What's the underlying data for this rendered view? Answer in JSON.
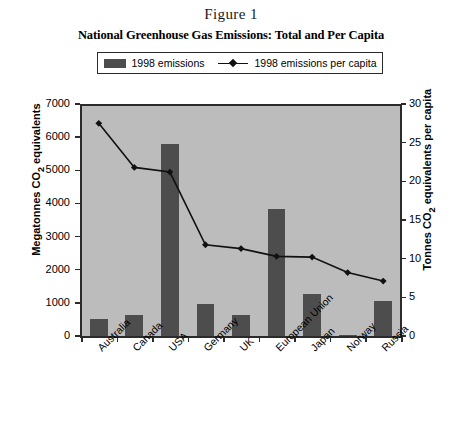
{
  "figure_label": "Figure 1",
  "legend": {
    "bar_label": "1998 emissions",
    "line_label": "1998 emissions per capita",
    "bar_swatch_icon": "bar-swatch-icon",
    "line_swatch_icon": "line-marker-swatch-icon"
  },
  "colors": {
    "bar_fill": "#4d4d4d",
    "plot_background": "#bcbcbc",
    "axis": "#2b2b2b",
    "line": "#111111",
    "page_background": "#ffffff"
  },
  "chart_data": {
    "type": "bar",
    "title": "National Greenhouse Gas Emissions: Total and Per Capita",
    "subtitle": "Figure 1",
    "xlabel": "",
    "ylabel": "Megatonnes CO₂ equivalents",
    "y2label": "Tonnes CO₂ equivalents per capita",
    "categories": [
      "Australia",
      "Canada",
      "USA",
      "Germany",
      "UK",
      "European Union",
      "Japan",
      "Norway",
      "Russia"
    ],
    "ylim": [
      0,
      7000
    ],
    "y2lim": [
      0,
      30
    ],
    "yticks": [
      0,
      1000,
      2000,
      3000,
      4000,
      5000,
      6000,
      7000
    ],
    "y2ticks": [
      0,
      5,
      10,
      15,
      20,
      25,
      30
    ],
    "grid": false,
    "legend_position": "top",
    "series": [
      {
        "name": "1998 emissions",
        "type": "bar",
        "axis": "left",
        "unit": "Megatonnes CO2 equivalents",
        "values": [
          520,
          640,
          5780,
          980,
          630,
          3830,
          1270,
          40,
          1050
        ]
      },
      {
        "name": "1998 emissions per capita",
        "type": "line",
        "axis": "right",
        "unit": "Tonnes CO2 equivalents per capita",
        "values": [
          27.5,
          21.8,
          21.2,
          11.8,
          11.3,
          10.3,
          10.2,
          8.2,
          7.1
        ]
      }
    ]
  }
}
